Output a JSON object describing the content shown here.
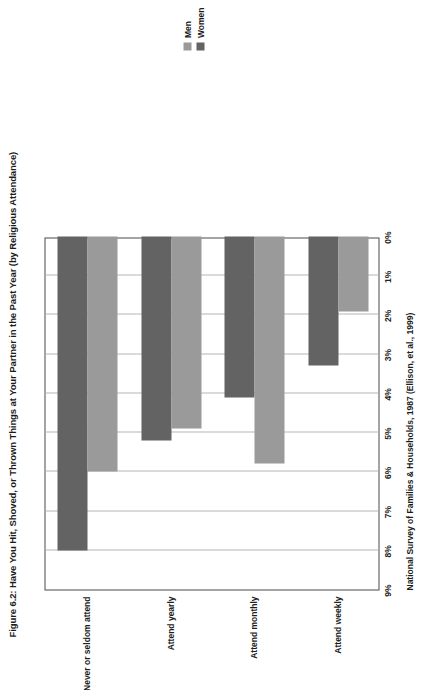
{
  "figure": {
    "title": "Figure 6.2: Have You Hit, Shoved, or Thrown Things at Your Partner in the Past Year (by Religious Attendance)",
    "source": "National Survey of Families & Households, 1987 (Ellison, et al., 1999)"
  },
  "legend": {
    "position": "top-right",
    "items": [
      {
        "label": "Men",
        "color": "#9a9a9a"
      },
      {
        "label": "Women",
        "color": "#636363"
      }
    ]
  },
  "chart_data": {
    "type": "bar",
    "orientation": "horizontal",
    "title": "Figure 6.2: Have You Hit, Shoved, or Thrown Things at Your Partner in the Past Year (by Religious Attendance)",
    "xlabel": "",
    "ylabel": "",
    "categories": [
      "Never or seldom attend",
      "Attend yearly",
      "Attend monthly",
      "Attend weekly"
    ],
    "series": [
      {
        "name": "Men",
        "color": "#9a9a9a",
        "values": [
          6.0,
          4.9,
          5.8,
          1.9
        ]
      },
      {
        "name": "Women",
        "color": "#636363",
        "values": [
          8.0,
          5.2,
          4.1,
          3.3
        ]
      }
    ],
    "value_axis": {
      "min": 0,
      "max": 9,
      "reversed": true,
      "unit": "%",
      "tick_labels": [
        "9%",
        "8%",
        "7%",
        "6%",
        "5%",
        "4%",
        "3%",
        "2%",
        "1%",
        "0%"
      ],
      "tick_values": [
        9,
        8,
        7,
        6,
        5,
        4,
        3,
        2,
        1,
        0
      ]
    },
    "grid": true,
    "legend_position": "top-right",
    "source": "National Survey of Families & Households, 1987 (Ellison, et al., 1999)"
  }
}
